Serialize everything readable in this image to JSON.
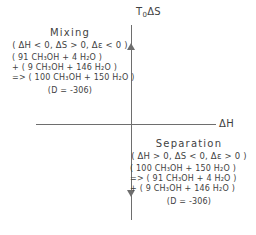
{
  "figure": {
    "type": "thermodynamic-quadrant-diagram",
    "background_color": "#ffffff",
    "ink_color": "#3f3f3f",
    "axis_color": "#6e6e6e"
  },
  "axes": {
    "vertical": {
      "name": "vertical-axis",
      "label_main": "T",
      "label_sub": "0",
      "label_tail": "ΔS",
      "label_full": "T₀ΔS",
      "arrow_up": true,
      "arrow_down": true
    },
    "horizontal": {
      "name": "horizontal-axis",
      "label_full": "ΔH",
      "arrow": false
    }
  },
  "annotations": {
    "mixing": {
      "title": "Mixing",
      "conditions": "( ΔH < 0,  ΔS > 0,  Δε < 0 )",
      "equations": [
        "( 91 CH₃OH + 4 H₂O )",
        "+ ( 9 CH₃OH + 146 H₂O )",
        "=> ( 100 CH₃OH + 150 H₂O )"
      ],
      "note": "(D = -306)"
    },
    "separation": {
      "title": "Separation",
      "conditions": "( ΔH > 0,  ΔS < 0,  Δε > 0 )",
      "equations": [
        "( 100 CH₃OH + 150 H₂O )",
        "=> ( 91 CH₃OH + 4 H₂O )",
        "+ ( 9 CH₃OH + 146 H₂O )"
      ],
      "note": "(D = -306)"
    }
  },
  "chart_data": {
    "type": "scatter",
    "title": "",
    "xlabel": "ΔH",
    "ylabel": "T₀ΔS",
    "grid": false,
    "legend": "none",
    "xlim": [
      -1,
      1
    ],
    "ylim": [
      -1,
      1
    ],
    "series": [],
    "annotations": [
      {
        "quadrant": "upper-left",
        "label": "Mixing",
        "delta_H": "< 0",
        "delta_S": "> 0",
        "delta_epsilon": "< 0",
        "D": -306,
        "reaction": "( 91 CH3OH + 4 H2O ) + ( 9 CH3OH + 146 H2O ) => ( 100 CH3OH + 150 H2O )"
      },
      {
        "quadrant": "lower-right",
        "label": "Separation",
        "delta_H": "> 0",
        "delta_S": "< 0",
        "delta_epsilon": "> 0",
        "D": -306,
        "reaction": "( 100 CH3OH + 150 H2O ) => ( 91 CH3OH + 4 H2O ) + ( 9 CH3OH + 146 H2O )"
      }
    ]
  }
}
